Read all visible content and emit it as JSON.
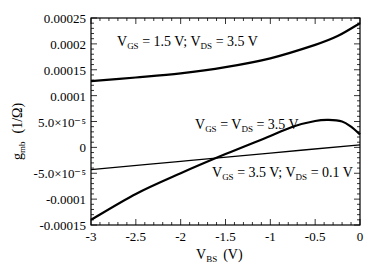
{
  "chart_data": {
    "type": "line",
    "title": "",
    "xlabel": "V_BS (V)",
    "xlabel_main": "V",
    "xlabel_sub": "BS",
    "xlabel_unit": "(V)",
    "ylabel": "g_mb (1/Ω)",
    "ylabel_main": "g",
    "ylabel_sub": "mb",
    "ylabel_unit": "(1/Ω)",
    "xlim": [
      -3,
      0
    ],
    "ylim": [
      -0.00015,
      0.00025
    ],
    "grid": false,
    "x_ticks": [
      -3,
      -2.5,
      -2,
      -1.5,
      -1,
      -0.5,
      0
    ],
    "x_tick_labels": [
      "-3",
      "-2.5",
      "-2",
      "-1.5",
      "-1",
      "-0.5",
      "0"
    ],
    "y_ticks": [
      0.00025,
      0.0002,
      0.00015,
      0.0001,
      5e-05,
      0,
      -5e-05,
      -0.0001,
      -0.00015
    ],
    "y_tick_labels": [
      "0.00025",
      "0.0002",
      "0.00015",
      "0.0001",
      "5.0×10⁻⁵",
      "0",
      "-5.0×10⁻⁵",
      "-0.0001",
      "-0.00015"
    ],
    "series": [
      {
        "name": "VGS = 1.5 V; VDS = 3.5 V",
        "label_parts": [
          "V",
          "GS",
          " = 1.5 V; V",
          "DS",
          " = 3.5 V"
        ],
        "x": [
          -3,
          -2.5,
          -2,
          -1.5,
          -1,
          -0.5,
          -0.25,
          0
        ],
        "y": [
          0.000128,
          0.000135,
          0.000143,
          0.000155,
          0.000172,
          0.000198,
          0.000215,
          0.00024
        ]
      },
      {
        "name": "VGS = VDS = 3.5 V",
        "label_parts": [
          "V",
          "GS",
          " = V",
          "DS",
          " = 3.5 V"
        ],
        "x": [
          -3,
          -2.5,
          -2,
          -1.5,
          -1,
          -0.75,
          -0.5,
          -0.35,
          -0.2,
          -0.1,
          0
        ],
        "y": [
          -0.00014,
          -9e-05,
          -5e-05,
          -1.3e-05,
          2.2e-05,
          4e-05,
          5.1e-05,
          5.3e-05,
          5e-05,
          4e-05,
          2.5e-05
        ]
      },
      {
        "name": "VGS = 3.5 V; VDS = 0.1 V",
        "label_parts": [
          "V",
          "GS",
          " = 3.5 V; V",
          "DS",
          " = 0.1 V"
        ],
        "x": [
          -3,
          -2,
          -1,
          0
        ],
        "y": [
          -4.3e-05,
          -2.7e-05,
          -1.1e-05,
          5e-06
        ]
      }
    ]
  }
}
